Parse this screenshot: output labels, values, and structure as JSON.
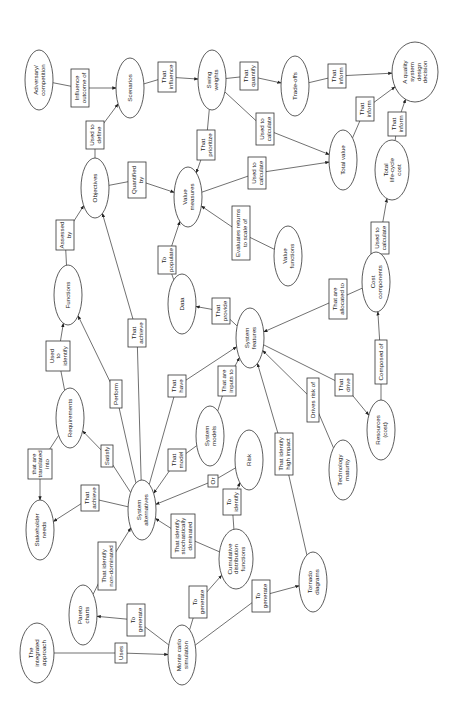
{
  "diagram": {
    "type": "concept-map",
    "orientation": "rotated-90-ccw",
    "nodes": [
      {
        "id": "adversary",
        "label": [
          "Adversary/",
          "competition"
        ],
        "x": 39,
        "y": 80,
        "rx": 14,
        "ry": 30
      },
      {
        "id": "scenarios",
        "label": [
          "Scenarios"
        ],
        "x": 130,
        "y": 88,
        "rx": 14,
        "ry": 30
      },
      {
        "id": "swing_weights",
        "label": [
          "Swing",
          "weights"
        ],
        "x": 212,
        "y": 80,
        "rx": 14,
        "ry": 30
      },
      {
        "id": "trade_offs",
        "label": [
          "Trade-offs"
        ],
        "x": 295,
        "y": 86,
        "rx": 14,
        "ry": 30
      },
      {
        "id": "quality_decision",
        "label": [
          "A quality",
          "system",
          "design",
          "decision"
        ],
        "x": 415,
        "y": 72,
        "rx": 23,
        "ry": 30
      },
      {
        "id": "objectives",
        "label": [
          "Objectives"
        ],
        "x": 95,
        "y": 188,
        "rx": 14,
        "ry": 30
      },
      {
        "id": "value_measures",
        "label": [
          "Value",
          "measures"
        ],
        "x": 188,
        "y": 197,
        "rx": 14,
        "ry": 30
      },
      {
        "id": "total_value",
        "label": [
          "Total value"
        ],
        "x": 343,
        "y": 160,
        "rx": 14,
        "ry": 30
      },
      {
        "id": "total_lcc",
        "label": [
          "Total",
          "life-cycle",
          "cost"
        ],
        "x": 392,
        "y": 170,
        "rx": 17,
        "ry": 30
      },
      {
        "id": "value_functions",
        "label": [
          "Value",
          "functions"
        ],
        "x": 288,
        "y": 256,
        "rx": 14,
        "ry": 30
      },
      {
        "id": "functions",
        "label": [
          "Functions"
        ],
        "x": 68,
        "y": 295,
        "rx": 14,
        "ry": 30
      },
      {
        "id": "data",
        "label": [
          "Data"
        ],
        "x": 182,
        "y": 304,
        "rx": 14,
        "ry": 30
      },
      {
        "id": "cost_components",
        "label": [
          "Cost",
          "components"
        ],
        "x": 376,
        "y": 282,
        "rx": 14,
        "ry": 30
      },
      {
        "id": "system_features",
        "label": [
          "System",
          "features"
        ],
        "x": 250,
        "y": 338,
        "rx": 14,
        "ry": 30
      },
      {
        "id": "requirements",
        "label": [
          "Requirements"
        ],
        "x": 70,
        "y": 418,
        "rx": 14,
        "ry": 30
      },
      {
        "id": "system_models",
        "label": [
          "System",
          "models"
        ],
        "x": 210,
        "y": 436,
        "rx": 14,
        "ry": 30
      },
      {
        "id": "risk",
        "label": [
          "Risk"
        ],
        "x": 249,
        "y": 460,
        "rx": 14,
        "ry": 30
      },
      {
        "id": "resources",
        "label": [
          "Resources",
          "(cost)"
        ],
        "x": 381,
        "y": 430,
        "rx": 14,
        "ry": 30
      },
      {
        "id": "stakeholder_needs",
        "label": [
          "Stakeholder",
          "needs"
        ],
        "x": 40,
        "y": 530,
        "rx": 14,
        "ry": 30
      },
      {
        "id": "system_alternatives",
        "label": [
          "System",
          "alternatives"
        ],
        "x": 142,
        "y": 510,
        "rx": 14,
        "ry": 30
      },
      {
        "id": "technology_maturity",
        "label": [
          "Technology",
          "maturity"
        ],
        "x": 343,
        "y": 470,
        "rx": 14,
        "ry": 30
      },
      {
        "id": "cdf",
        "label": [
          "Cumulative",
          "distribution",
          "functions"
        ],
        "x": 236,
        "y": 559,
        "rx": 17,
        "ry": 30
      },
      {
        "id": "pareto_charts",
        "label": [
          "Pareto",
          "charts"
        ],
        "x": 83,
        "y": 615,
        "rx": 14,
        "ry": 30
      },
      {
        "id": "the_integrated_approach",
        "label": [
          "The",
          "integrated",
          "approach"
        ],
        "x": 37,
        "y": 653,
        "rx": 17,
        "ry": 30
      },
      {
        "id": "monte_carlo",
        "label": [
          "Monte carlo",
          "simulation"
        ],
        "x": 182,
        "y": 655,
        "rx": 14,
        "ry": 30
      },
      {
        "id": "tornado_diagrams",
        "label": [
          "Tornado",
          "diagrams"
        ],
        "x": 313,
        "y": 582,
        "rx": 14,
        "ry": 30
      }
    ],
    "edges": [
      {
        "from": "adversary",
        "to": "scenarios",
        "label": [
          "Influence",
          "outcome of"
        ],
        "lx": 80,
        "ly": 88,
        "lw": 18,
        "lh": 38
      },
      {
        "from": "scenarios",
        "to": "swing_weights",
        "label": [
          "That",
          "influence"
        ],
        "lx": 167,
        "ly": 77,
        "lw": 18,
        "lh": 30
      },
      {
        "from": "swing_weights",
        "to": "trade_offs",
        "label": [
          "That",
          "quantify"
        ],
        "lx": 249,
        "ly": 76,
        "lw": 18,
        "lh": 28
      },
      {
        "from": "trade_offs",
        "to": "quality_decision",
        "label": [
          "That",
          "inform"
        ],
        "lx": 337,
        "ly": 76,
        "lw": 18,
        "lh": 24
      },
      {
        "from": "objectives",
        "to": "scenarios",
        "label": [
          "Used to",
          "define"
        ],
        "lx": 95,
        "ly": 135,
        "lw": 18,
        "lh": 28
      },
      {
        "from": "swing_weights",
        "to": "value_measures",
        "label": [
          "That",
          "prioritize"
        ],
        "lx": 206,
        "ly": 145,
        "lw": 18,
        "lh": 30
      },
      {
        "from": "swing_weights",
        "to": "total_value",
        "label": [
          "Used to",
          "calculate"
        ],
        "lx": 265,
        "ly": 129,
        "lw": 18,
        "lh": 32
      },
      {
        "from": "total_value",
        "to": "quality_decision",
        "label": [
          "That",
          "inform"
        ],
        "lx": 365,
        "ly": 109,
        "lw": 18,
        "lh": 24
      },
      {
        "from": "total_lcc",
        "to": "quality_decision",
        "label": [
          "That",
          "inform"
        ],
        "lx": 397,
        "ly": 124,
        "lw": 18,
        "lh": 24
      },
      {
        "from": "objectives",
        "to": "value_measures",
        "label": [
          "Quantified",
          "by"
        ],
        "lx": 137,
        "ly": 180,
        "lw": 18,
        "lh": 36
      },
      {
        "from": "value_measures",
        "to": "total_value",
        "label": [
          "Used to",
          "calculate"
        ],
        "lx": 257,
        "ly": 173,
        "lw": 18,
        "lh": 32
      },
      {
        "from": "value_functions",
        "to": "value_measures",
        "label": [
          "Evaluates returns",
          "to scale of"
        ],
        "lx": 241,
        "ly": 233,
        "lw": 18,
        "lh": 54
      },
      {
        "from": "cost_components",
        "to": "total_lcc",
        "label": [
          "Used to",
          "calculate"
        ],
        "lx": 380,
        "ly": 238,
        "lw": 18,
        "lh": 32
      },
      {
        "from": "functions",
        "to": "objectives",
        "label": [
          "Assessed",
          "by"
        ],
        "lx": 65,
        "ly": 235,
        "lw": 18,
        "lh": 30
      },
      {
        "from": "data",
        "to": "value_measures",
        "label": [
          "To",
          "populate"
        ],
        "lx": 167,
        "ly": 260,
        "lw": 18,
        "lh": 28
      },
      {
        "from": "system_features",
        "to": "data",
        "label": [
          "That",
          "provide"
        ],
        "lx": 221,
        "ly": 311,
        "lw": 18,
        "lh": 26
      },
      {
        "from": "cost_components",
        "to": "system_features",
        "label": [
          "That are",
          "allocated to"
        ],
        "lx": 338,
        "ly": 299,
        "lw": 18,
        "lh": 40
      },
      {
        "from": "requirements",
        "to": "functions",
        "label": [
          "Used",
          "to",
          "identify"
        ],
        "lx": 58,
        "ly": 356,
        "lw": 24,
        "lh": 30
      },
      {
        "from": "system_alternatives",
        "to": "objectives",
        "label": [
          "That",
          "achieve"
        ],
        "lx": 137,
        "ly": 333,
        "lw": 18,
        "lh": 28
      },
      {
        "from": "system_alternatives",
        "to": "functions",
        "label": [
          "Perform"
        ],
        "lx": 116,
        "ly": 394,
        "lw": 12,
        "lh": 28
      },
      {
        "from": "system_alternatives",
        "to": "system_features",
        "label": [
          "That",
          "have"
        ],
        "lx": 177,
        "ly": 386,
        "lw": 18,
        "lh": 22
      },
      {
        "from": "system_models",
        "to": "system_features",
        "label": [
          "That are",
          "inputs to"
        ],
        "lx": 227,
        "ly": 381,
        "lw": 18,
        "lh": 30
      },
      {
        "from": "resources",
        "to": "cost_components",
        "label": [
          "Composed of"
        ],
        "lx": 381,
        "ly": 362,
        "lw": 12,
        "lh": 44
      },
      {
        "from": "system_features",
        "to": "resources",
        "label": [
          "That",
          "drive"
        ],
        "lx": 344,
        "ly": 385,
        "lw": 18,
        "lh": 22
      },
      {
        "from": "technology_maturity",
        "to": "system_features",
        "label": [
          "Drives risk of"
        ],
        "lx": 313,
        "ly": 400,
        "lw": 12,
        "lh": 44
      },
      {
        "from": "tornado_diagrams",
        "to": "system_features",
        "label": [
          "That identify",
          "high impact"
        ],
        "lx": 284,
        "ly": 454,
        "lw": 18,
        "lh": 42
      },
      {
        "from": "requirements",
        "to": "stakeholder_needs",
        "label": [
          "that are",
          "translated",
          "into"
        ],
        "lx": 40,
        "ly": 464,
        "lw": 24,
        "lh": 30
      },
      {
        "from": "system_alternatives",
        "to": "requirements",
        "label": [
          "Satisfy"
        ],
        "lx": 107,
        "ly": 456,
        "lw": 12,
        "lh": 22
      },
      {
        "from": "system_models",
        "to": "system_alternatives",
        "label": [
          "That",
          "model"
        ],
        "lx": 177,
        "ly": 460,
        "lw": 18,
        "lh": 22
      },
      {
        "from": "risk",
        "to": "system_alternatives",
        "label": [
          "Or"
        ],
        "lx": 213,
        "ly": 481,
        "lw": 10,
        "lh": 12
      },
      {
        "from": "system_alternatives",
        "to": "stakeholder_needs",
        "label": [
          "That",
          "achieve"
        ],
        "lx": 90,
        "ly": 498,
        "lw": 18,
        "lh": 26
      },
      {
        "from": "cdf",
        "to": "risk",
        "label": [
          "To",
          "identify"
        ],
        "lx": 232,
        "ly": 502,
        "lw": 18,
        "lh": 26
      },
      {
        "from": "cdf",
        "to": "system_alternatives",
        "label": [
          "That identify",
          "stochastically",
          "dominated"
        ],
        "lx": 183,
        "ly": 536,
        "lw": 24,
        "lh": 44
      },
      {
        "from": "pareto_charts",
        "to": "system_alternatives",
        "label": [
          "That identify",
          "non-dominated"
        ],
        "lx": 107,
        "ly": 566,
        "lw": 18,
        "lh": 48
      },
      {
        "from": "monte_carlo",
        "to": "pareto_charts",
        "label": [
          "To",
          "generate"
        ],
        "lx": 136,
        "ly": 620,
        "lw": 18,
        "lh": 32
      },
      {
        "from": "monte_carlo",
        "to": "cdf",
        "label": [
          "To",
          "generate"
        ],
        "lx": 198,
        "ly": 602,
        "lw": 18,
        "lh": 32
      },
      {
        "from": "the_integrated_approach",
        "to": "monte_carlo",
        "label": [
          "Uses"
        ],
        "lx": 121,
        "ly": 653,
        "lw": 12,
        "lh": 20
      },
      {
        "from": "monte_carlo",
        "to": "tornado_diagrams",
        "label": [
          "To",
          "generate"
        ],
        "lx": 261,
        "ly": 596,
        "lw": 18,
        "lh": 32
      }
    ]
  },
  "colors": {
    "stroke": "#333333",
    "text": "#222222",
    "background": "#ffffff"
  }
}
